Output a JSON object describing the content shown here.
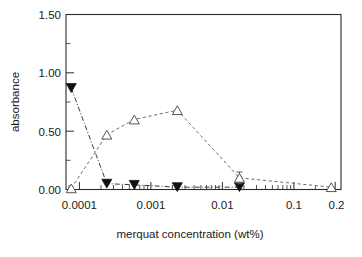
{
  "chart_data": {
    "type": "line",
    "title": "",
    "subtitle": "",
    "xlabel": "merquat concentration (wt%)",
    "ylabel": "absorbance",
    "xscale": "log",
    "yscale": "linear",
    "xlim": [
      6e-05,
      0.2
    ],
    "ylim": [
      0.0,
      1.5
    ],
    "grid": false,
    "legend": "none",
    "xticks": [
      0.0001,
      0.001,
      0.01,
      0.1,
      0.2
    ],
    "xticklabels": [
      "0.0001",
      "0.001",
      "0.01",
      "0.1",
      "0.2"
    ],
    "yticks": [
      0.0,
      0.5,
      1.0,
      1.5
    ],
    "yticklabels": [
      "0.00",
      "0.50",
      "1.00",
      "1.50"
    ],
    "series": [
      {
        "name": "filled-triangle-series",
        "marker": "triangle-down-filled",
        "linestyle": "dash-dot",
        "x": [
          7e-05,
          0.0002,
          0.00045,
          0.0016,
          0.01
        ],
        "y": [
          0.87,
          0.05,
          0.04,
          0.02,
          0.02
        ],
        "yerr": [
          0,
          0,
          0,
          0,
          0
        ]
      },
      {
        "name": "open-triangle-series",
        "marker": "triangle-up-open",
        "linestyle": "dashed",
        "x": [
          7e-05,
          0.0002,
          0.00045,
          0.0016,
          0.01,
          0.15
        ],
        "y": [
          0.01,
          0.47,
          0.6,
          0.68,
          0.1,
          0.02
        ],
        "yerr": [
          0,
          0,
          0,
          0,
          0.05,
          0
        ]
      }
    ]
  },
  "figure": {
    "xaxis_title": "merquat concentration (wt%)",
    "yaxis_title": "absorbance",
    "ytick_labels": [
      "1.50",
      "1.00",
      "0.50",
      "0.00"
    ],
    "xtick_labels": [
      "0.0001",
      "0.001",
      "0.01",
      "0.1",
      "0.2"
    ]
  },
  "colors": {
    "axis": "#2b2b2b",
    "open_series": "#6e6e6e",
    "filled_series": "#101010",
    "background": "#ffffff"
  }
}
